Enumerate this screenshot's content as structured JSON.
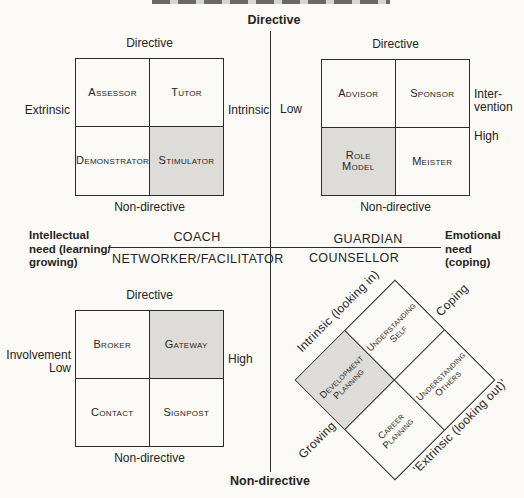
{
  "figure": {
    "top_label": "Directive",
    "bottom_label": "Non-directive",
    "left_label": "Intellectual\nneed (learning/\ngrowing)",
    "right_label": "Emotional\nneed\n(coping)",
    "center_labels": {
      "coach": "COACH",
      "networker": "NETWORKER/FACILITATOR",
      "guardian": "GUARDIAN",
      "counsellor": "COUNSELLOR"
    },
    "coach_matrix": {
      "top": "Directive",
      "bottom": "Non-directive",
      "left": "Extrinsic",
      "right": "Intrinsic",
      "cells": {
        "tl": "Assessor",
        "tr": "Tutor",
        "bl": "Demonstrator",
        "br": "Stimulator"
      },
      "shaded_cell": "br"
    },
    "guardian_matrix": {
      "top": "Directive",
      "bottom": "Non-directive",
      "left": "Low",
      "right_top": "Inter-\nvention",
      "right_bottom": "High",
      "cells": {
        "tl": "Advisor",
        "tr": "Sponsor",
        "bl": "Role\nModel",
        "br": "Meister"
      },
      "shaded_cell": "bl"
    },
    "networker_matrix": {
      "top": "Directive",
      "bottom": "Non-directive",
      "left": "Involvement\nLow",
      "right": "High",
      "cells": {
        "tl": "Broker",
        "tr": "Gateway",
        "bl": "Contact",
        "br": "Signpost"
      },
      "shaded_cell": "tr"
    },
    "counsellor_diamond": {
      "edge_top_left": "Intrinsic (looking in)",
      "edge_top_right": "Coping",
      "edge_bottom_left": "Growing",
      "edge_bottom_right": "'Extrinsic (looking out)'",
      "cells": {
        "west": "Development\nPlanning",
        "north": "Understanding\nSelf",
        "east": "Understanding\nOthers",
        "south": "Career\nPlanning"
      },
      "shaded_cell": "west"
    },
    "colors": {
      "background": "#fbfaf7",
      "line": "#2e2c28",
      "text": "#262420",
      "shaded": "#dedcd8"
    }
  }
}
